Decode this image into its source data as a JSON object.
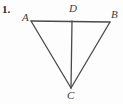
{
  "figure": {
    "problem_number": "1.",
    "background_color": "#fdfdfd",
    "stroke_color": "#4a4a4a",
    "label_color": "#3b3b3b",
    "stroke_width": 1.3,
    "width": 123,
    "height": 104,
    "points": [
      {
        "name": "A",
        "label": "A",
        "x": 31,
        "y": 21,
        "label_x": 22,
        "label_y": 12
      },
      {
        "name": "D",
        "label": "D",
        "x": 72,
        "y": 21,
        "label_x": 69,
        "label_y": 3
      },
      {
        "name": "B",
        "label": "B",
        "x": 110,
        "y": 22,
        "label_x": 111,
        "label_y": 9
      },
      {
        "name": "C",
        "label": "C",
        "x": 71,
        "y": 88,
        "label_x": 67,
        "label_y": 90
      }
    ],
    "segments": [
      {
        "name": "segment-AB",
        "from": "A",
        "to": "B",
        "x1": 31,
        "y1": 21,
        "x2": 110,
        "y2": 22
      },
      {
        "name": "segment-AC",
        "from": "A",
        "to": "C",
        "x1": 31,
        "y1": 21,
        "x2": 71,
        "y2": 88
      },
      {
        "name": "segment-BC",
        "from": "B",
        "to": "C",
        "x1": 110,
        "y1": 22,
        "x2": 71,
        "y2": 88
      },
      {
        "name": "segment-DC",
        "from": "D",
        "to": "C",
        "x1": 72,
        "y1": 21,
        "x2": 71,
        "y2": 88
      }
    ]
  }
}
